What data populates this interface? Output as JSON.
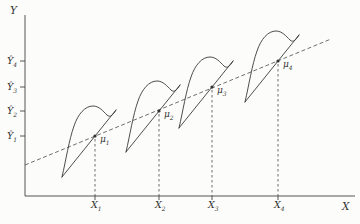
{
  "figure": {
    "y_axis_label": "Y",
    "x_axis_label": "X",
    "y_ticks": [
      {
        "base": "Ŷ",
        "sub": "4"
      },
      {
        "base": "Ŷ",
        "sub": "3"
      },
      {
        "base": "Ŷ",
        "sub": "2"
      },
      {
        "base": "Ŷ",
        "sub": "1"
      }
    ],
    "x_ticks": [
      {
        "base": "X",
        "sub": "1"
      },
      {
        "base": "X",
        "sub": "2"
      },
      {
        "base": "X",
        "sub": "3"
      },
      {
        "base": "X",
        "sub": "4"
      }
    ],
    "means": [
      {
        "base": "μ",
        "sub": "1"
      },
      {
        "base": "μ",
        "sub": "2"
      },
      {
        "base": "μ",
        "sub": "3"
      },
      {
        "base": "μ",
        "sub": "4"
      }
    ],
    "colors": {
      "ink": "#3a3a3a",
      "background": "#fcfcfa"
    }
  }
}
